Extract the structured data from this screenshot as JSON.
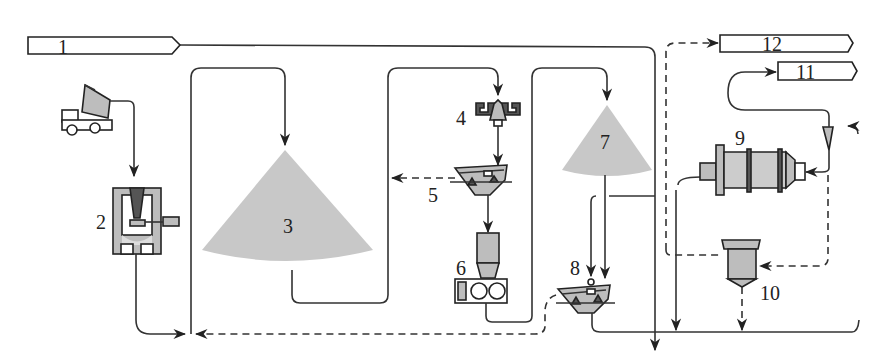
{
  "diagram": {
    "type": "process-flow",
    "title": "",
    "colors": {
      "line": "#333333",
      "pile": "#c8c8c8",
      "equipment": "#bdbdbd"
    },
    "streams": [
      {
        "id": "1",
        "label": "1",
        "role": "input-arrow-box"
      },
      {
        "id": "11",
        "label": "11",
        "role": "output-arrow-box"
      },
      {
        "id": "12",
        "label": "12",
        "role": "output-arrow-box"
      }
    ],
    "units": [
      {
        "id": "truck",
        "label": "",
        "kind": "dump-truck"
      },
      {
        "id": "2",
        "label": "2",
        "kind": "gyratory-crusher"
      },
      {
        "id": "3",
        "label": "3",
        "kind": "stockpile"
      },
      {
        "id": "4",
        "label": "4",
        "kind": "feeder"
      },
      {
        "id": "5",
        "label": "5",
        "kind": "screen"
      },
      {
        "id": "6",
        "label": "6",
        "kind": "cone-crusher"
      },
      {
        "id": "7",
        "label": "7",
        "kind": "stockpile"
      },
      {
        "id": "8",
        "label": "8",
        "kind": "screen"
      },
      {
        "id": "9",
        "label": "9",
        "kind": "ball-mill"
      },
      {
        "id": "10",
        "label": "10",
        "kind": "thickener"
      },
      {
        "id": "cyclone",
        "label": "",
        "kind": "hydrocyclone"
      }
    ],
    "line_styles": {
      "solid": "material flow",
      "dashed": "fines / slurry flow"
    }
  }
}
